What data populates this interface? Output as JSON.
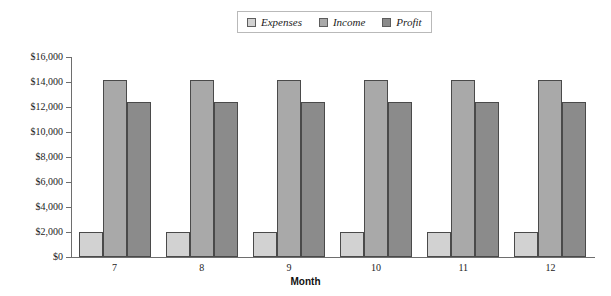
{
  "chart_data": {
    "type": "bar",
    "title": "",
    "xlabel": "Month",
    "ylabel": "",
    "categories": [
      "7",
      "8",
      "9",
      "10",
      "11",
      "12"
    ],
    "series": [
      {
        "name": "Expenses",
        "values": [
          2000,
          2000,
          2000,
          2000,
          2000,
          2000
        ],
        "color": "#d2d2d2"
      },
      {
        "name": "Income",
        "values": [
          14200,
          14200,
          14200,
          14200,
          14200,
          14200
        ],
        "color": "#a9a9a9"
      },
      {
        "name": "Profit",
        "values": [
          12400,
          12400,
          12400,
          12400,
          12400,
          12400
        ],
        "color": "#8b8b8b"
      }
    ],
    "ylim": [
      0,
      16000
    ],
    "ytick_values": [
      0,
      2000,
      4000,
      6000,
      8000,
      10000,
      12000,
      14000,
      16000
    ],
    "ytick_labels": [
      "$0",
      "$2,000",
      "$4,000",
      "$6,000",
      "$8,000",
      "$10,000",
      "$12,000",
      "$14,000",
      "$16,000"
    ],
    "grid": false,
    "legend_position": "top-center",
    "legend_entries": [
      "Expenses",
      "Income",
      "Profit"
    ]
  },
  "axis": {
    "x_title": "Month"
  },
  "colors": {
    "expenses": "#d2d2d2",
    "income": "#a9a9a9",
    "profit": "#8b8b8b",
    "bar_border": "#4a4a4a",
    "axis": "#6e6e6e",
    "legend_border": "#b9b9b9",
    "text": "#1c1c1c",
    "background": "#ffffff"
  }
}
